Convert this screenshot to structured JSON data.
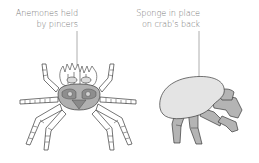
{
  "figure": {
    "panels": [
      {
        "id": "decorator-crab",
        "label_lines": [
          "Anemones held",
          "by pincers"
        ]
      },
      {
        "id": "sponge-crab",
        "label_lines": [
          "Sponge in place",
          "on crab's back"
        ]
      }
    ],
    "colors": {
      "label_text": "#7a7a7a",
      "leader_line": "#9a9a9a",
      "outline": "#3a3a3a",
      "shell_fill": "#a9a9a9",
      "shell_dark": "#8a8a8a",
      "sponge_fill": "#e4e4e4",
      "body_fill": "#b4b4b4"
    }
  }
}
